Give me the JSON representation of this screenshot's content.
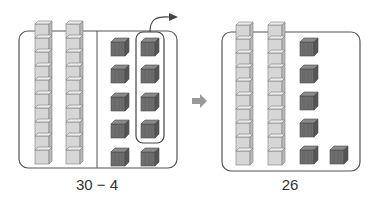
{
  "panels": {
    "left": {
      "label": "30 − 4",
      "rods": 2,
      "cubes": 10,
      "removed": 4
    },
    "right": {
      "label": "26",
      "rods": 2,
      "cubes": 6
    }
  },
  "colors": {
    "rod_fill": "#d4d4d4",
    "rod_stroke": "#8a8a8a",
    "cube_fill": "#6f6f6f",
    "frame_stroke": "#555555",
    "arrow_fill": "#9a9a9a"
  }
}
